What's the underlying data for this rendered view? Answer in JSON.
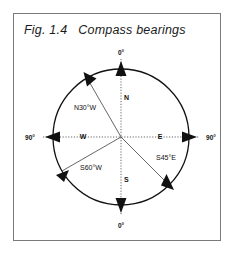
{
  "figure": {
    "caption": "Fig. 1.4   Compass bearings",
    "border_color": "#7a7a7a",
    "background": "#ffffff",
    "stroke_color": "#111111"
  },
  "compass": {
    "center": {
      "x": 121,
      "y": 137
    },
    "radius": 68,
    "cardinal_labels": {
      "north": "N",
      "south": "S",
      "east": "E",
      "west": "W"
    },
    "degree_labels": {
      "top": "0°",
      "bottom": "0°",
      "left": "90°",
      "right": "90°"
    },
    "bearings": [
      {
        "label": "N30°W",
        "angle_deg": 330,
        "direction": "up-left"
      },
      {
        "label": "S60°W",
        "angle_deg": 240,
        "direction": "down-left"
      },
      {
        "label": "S45°E",
        "angle_deg": 135,
        "direction": "down-right"
      }
    ],
    "axes": [
      {
        "name": "north-axis",
        "direction": "up",
        "style": "dotted",
        "arrow": "up"
      },
      {
        "name": "south-axis",
        "direction": "down",
        "style": "dotted",
        "arrow": "down"
      },
      {
        "name": "east-axis",
        "direction": "right",
        "style": "dotted",
        "arrow": "right"
      },
      {
        "name": "west-axis",
        "direction": "left",
        "style": "dotted",
        "arrow": "left"
      }
    ]
  }
}
